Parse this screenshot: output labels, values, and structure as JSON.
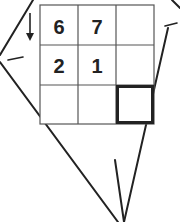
{
  "puzzle": {
    "grid": [
      [
        "6",
        "7",
        ""
      ],
      [
        "2",
        "1",
        ""
      ],
      [
        "",
        "",
        ""
      ]
    ],
    "highlighted_cell": {
      "row": 2,
      "col": 2
    },
    "arrow_direction": "down"
  },
  "colors": {
    "line": "#222222",
    "background": "#ffffff"
  }
}
